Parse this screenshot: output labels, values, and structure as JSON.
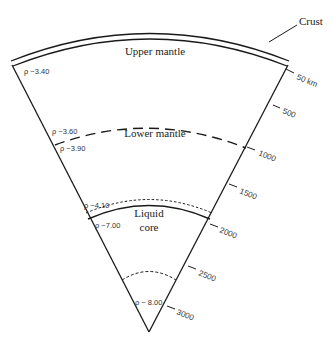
{
  "diagram": {
    "labels": {
      "crust": "Crust",
      "upper_mantle": "Upper mantle",
      "lower_mantle": "Lower mantle",
      "liquid_core_line1": "Liquid",
      "liquid_core_line2": "core"
    },
    "densities": {
      "upper_mantle_top": "ρ ~3.40",
      "upper_mantle_bottom": "ρ ~3.60",
      "lower_mantle_top": "ρ ~3.90",
      "lower_mantle_bottom": "ρ ~4.10",
      "core_top": "ρ ~7.00",
      "inner": "ρ ~ 8.00"
    },
    "depth_ticks": [
      {
        "label": "50 km",
        "value": 50
      },
      {
        "label": "500",
        "value": 500
      },
      {
        "label": "1000",
        "value": 1000
      },
      {
        "label": "1500",
        "value": 1500
      },
      {
        "label": "2000",
        "value": 2000
      },
      {
        "label": "2500",
        "value": 2500
      },
      {
        "label": "3000",
        "value": 3000
      }
    ],
    "colors": {
      "line": "#1a1a1a",
      "text": "#222222",
      "background": "#ffffff"
    }
  }
}
